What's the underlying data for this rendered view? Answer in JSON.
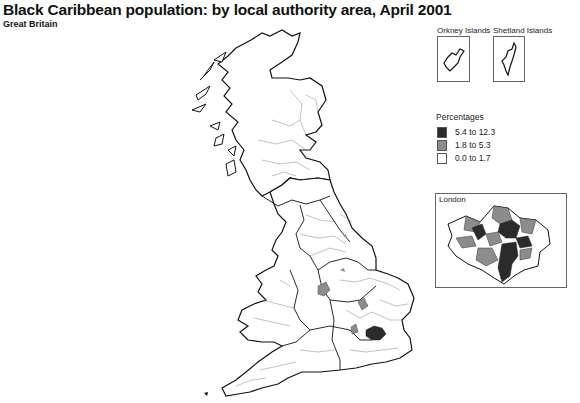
{
  "header": {
    "title": "Black Caribbean population: by local authority area, April 2001",
    "subtitle": "Great Britain"
  },
  "insets": {
    "orkney": {
      "label": "Orkney Islands"
    },
    "shetland": {
      "label": "Shetland Islands"
    },
    "london": {
      "label": "London"
    }
  },
  "legend": {
    "title": "Percentages",
    "items": [
      {
        "label": "5.4 to 12.3",
        "color": "#2b2b2b"
      },
      {
        "label": "1.8 to 5.3",
        "color": "#8c8c8c"
      },
      {
        "label": "0.0 to 1.7",
        "color": "#ffffff"
      }
    ]
  },
  "colors": {
    "dark": "#2b2b2b",
    "mid": "#8c8c8c",
    "light": "#ffffff",
    "border": "#111111"
  }
}
